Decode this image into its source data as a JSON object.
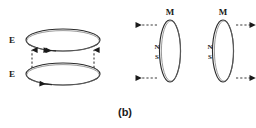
{
  "figure": {
    "caption": "(b)",
    "background_color": "#ffffff",
    "line_color": "#2b2b2b",
    "text_color": "#1a1a1a"
  },
  "left_diagram": {
    "name": "electric-field-loops",
    "loops": [
      {
        "id": "upper-e-loop",
        "label": "E",
        "orientation": "horizontal",
        "center": [
          63,
          40
        ],
        "rx": 37,
        "ry": 11,
        "arrow_direction": "left",
        "label_position": [
          12,
          43
        ]
      },
      {
        "id": "lower-e-loop",
        "label": "E",
        "orientation": "horizontal",
        "center": [
          63,
          74
        ],
        "rx": 37,
        "ry": 11,
        "arrow_direction": "left",
        "label_position": [
          12,
          77
        ]
      }
    ],
    "connectors": [
      {
        "id": "left-connector",
        "x": 32,
        "y_from": 68,
        "y_to": 48,
        "direction": "up",
        "style": "dashed"
      },
      {
        "id": "right-connector",
        "x": 94,
        "y_from": 68,
        "y_to": 48,
        "direction": "up",
        "style": "dashed"
      }
    ]
  },
  "right_diagram": {
    "name": "magnetic-field-loops",
    "loops": [
      {
        "id": "left-m-loop",
        "label": "M",
        "orientation": "vertical",
        "center": [
          170,
          51
        ],
        "rx": 10.5,
        "ry": 31,
        "label_position": [
          170,
          14
        ],
        "pole_north": "N",
        "pole_south": "S",
        "pole_position": [
          157,
          50
        ],
        "pole_side": "left"
      },
      {
        "id": "right-m-loop",
        "label": "M",
        "orientation": "vertical",
        "center": [
          223,
          51
        ],
        "rx": 10.5,
        "ry": 31,
        "label_position": [
          223,
          14
        ],
        "pole_north": "N",
        "pole_south": "S",
        "pole_position": [
          210,
          50
        ],
        "pole_side": "left"
      }
    ],
    "arrows": [
      {
        "id": "top-left-arrow",
        "x_from": 157,
        "x_to": 134,
        "y": 25,
        "direction": "left",
        "style": "dashed"
      },
      {
        "id": "top-right-arrow",
        "x_from": 236,
        "x_to": 252,
        "y": 25,
        "direction": "right",
        "style": "dashed"
      },
      {
        "id": "bottom-left-arrow",
        "x_from": 157,
        "x_to": 134,
        "y": 78,
        "direction": "left",
        "style": "dashed"
      },
      {
        "id": "bottom-right-arrow",
        "x_from": 236,
        "x_to": 252,
        "y": 78,
        "direction": "right",
        "style": "dashed"
      }
    ]
  }
}
